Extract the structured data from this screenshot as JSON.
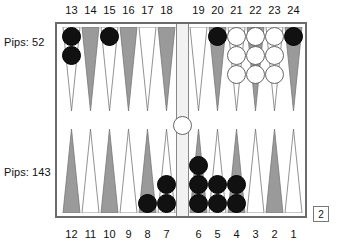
{
  "board": {
    "title": "Backgammon Board",
    "colors": {
      "point_dark": "#9a9a9a",
      "point_light": "#ffffff",
      "point_outline": "#777777",
      "checker_black": "#111111",
      "checker_white": "#ffffff",
      "frame": "#6b6b6b",
      "bar": "#f2f2f2",
      "background": "#ffffff",
      "text": "#111111"
    },
    "pips": {
      "top_label": "Pips: 52",
      "bottom_label": "Pips: 143",
      "top_value": 52,
      "bottom_value": 143
    },
    "doubling_cube": {
      "value": "2",
      "owner": "bottom"
    },
    "top_numbers": [
      "13",
      "14",
      "15",
      "16",
      "17",
      "18",
      "19",
      "20",
      "21",
      "22",
      "23",
      "24"
    ],
    "bottom_numbers": [
      "12",
      "11",
      "10",
      "9",
      "8",
      "7",
      "6",
      "5",
      "4",
      "3",
      "2",
      "1"
    ],
    "bar_checkers": {
      "white": 1,
      "black": 0
    },
    "points": [
      {
        "number": "13",
        "row": "top",
        "slot": 0,
        "shade": "light",
        "checkers": 2,
        "color": "black"
      },
      {
        "number": "14",
        "row": "top",
        "slot": 1,
        "shade": "dark",
        "checkers": 0,
        "color": "none"
      },
      {
        "number": "15",
        "row": "top",
        "slot": 2,
        "shade": "light",
        "checkers": 1,
        "color": "black"
      },
      {
        "number": "16",
        "row": "top",
        "slot": 3,
        "shade": "dark",
        "checkers": 0,
        "color": "none"
      },
      {
        "number": "17",
        "row": "top",
        "slot": 4,
        "shade": "light",
        "checkers": 0,
        "color": "none"
      },
      {
        "number": "18",
        "row": "top",
        "slot": 5,
        "shade": "dark",
        "checkers": 0,
        "color": "none"
      },
      {
        "number": "19",
        "row": "top",
        "slot": 6,
        "shade": "light",
        "checkers": 0,
        "color": "none"
      },
      {
        "number": "20",
        "row": "top",
        "slot": 7,
        "shade": "dark",
        "checkers": 1,
        "color": "black"
      },
      {
        "number": "21",
        "row": "top",
        "slot": 8,
        "shade": "light",
        "checkers": 3,
        "color": "white"
      },
      {
        "number": "22",
        "row": "top",
        "slot": 9,
        "shade": "dark",
        "checkers": 3,
        "color": "white"
      },
      {
        "number": "23",
        "row": "top",
        "slot": 10,
        "shade": "light",
        "checkers": 3,
        "color": "white"
      },
      {
        "number": "24",
        "row": "top",
        "slot": 11,
        "shade": "dark",
        "checkers": 1,
        "color": "black"
      },
      {
        "number": "12",
        "row": "bottom",
        "slot": 0,
        "shade": "dark",
        "checkers": 0,
        "color": "none"
      },
      {
        "number": "11",
        "row": "bottom",
        "slot": 1,
        "shade": "light",
        "checkers": 0,
        "color": "none"
      },
      {
        "number": "10",
        "row": "bottom",
        "slot": 2,
        "shade": "dark",
        "checkers": 0,
        "color": "none"
      },
      {
        "number": "9",
        "row": "bottom",
        "slot": 3,
        "shade": "light",
        "checkers": 0,
        "color": "none"
      },
      {
        "number": "8",
        "row": "bottom",
        "slot": 4,
        "shade": "dark",
        "checkers": 1,
        "color": "black"
      },
      {
        "number": "7",
        "row": "bottom",
        "slot": 5,
        "shade": "light",
        "checkers": 2,
        "color": "black"
      },
      {
        "number": "6",
        "row": "bottom",
        "slot": 6,
        "shade": "dark",
        "checkers": 3,
        "color": "black"
      },
      {
        "number": "5",
        "row": "bottom",
        "slot": 7,
        "shade": "light",
        "checkers": 2,
        "color": "black"
      },
      {
        "number": "4",
        "row": "bottom",
        "slot": 8,
        "shade": "dark",
        "checkers": 2,
        "color": "black"
      },
      {
        "number": "3",
        "row": "bottom",
        "slot": 9,
        "shade": "light",
        "checkers": 0,
        "color": "none"
      },
      {
        "number": "2",
        "row": "bottom",
        "slot": 10,
        "shade": "dark",
        "checkers": 0,
        "color": "none"
      },
      {
        "number": "1",
        "row": "bottom",
        "slot": 11,
        "shade": "light",
        "checkers": 0,
        "color": "none"
      }
    ]
  }
}
